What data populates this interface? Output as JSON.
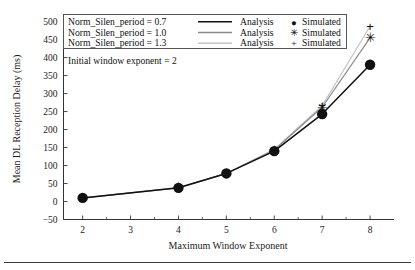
{
  "chart_data": {
    "type": "line",
    "title": "",
    "xlabel": "Maximum Window Exponent",
    "ylabel": "Mean DL Reception Delay (ms)",
    "xlim": [
      1.6,
      8.5
    ],
    "ylim": [
      -50,
      510
    ],
    "grid": false,
    "legend_position": "top-left-inside",
    "x": [
      2,
      4,
      5,
      6,
      7,
      8
    ],
    "xticks": [
      2,
      3,
      4,
      5,
      6,
      7,
      8
    ],
    "xtick_labels": [
      "2",
      "3",
      "4",
      "5",
      "6",
      "7",
      "8"
    ],
    "yticks": [
      -50,
      0,
      50,
      100,
      150,
      200,
      250,
      300,
      350,
      400,
      450,
      500
    ],
    "ytick_labels": [
      "−50",
      "0",
      "50",
      "100",
      "150",
      "200",
      "250",
      "300",
      "350",
      "400",
      "450",
      "500"
    ],
    "annotation": "Initial window exponent = 2",
    "series": [
      {
        "name": "Norm_Silen_period = 0.7",
        "analysis_label": "Analysis",
        "simulated_label": "Simulated",
        "marker": "circle",
        "color": "#111111",
        "line_width": 1.5,
        "values": [
          10,
          38,
          78,
          140,
          243,
          380
        ]
      },
      {
        "name": "Norm_Silen_period = 1.0",
        "analysis_label": "Analysis",
        "simulated_label": "Simulated",
        "marker": "asterisk",
        "color": "#8a8a8a",
        "line_width": 1.2,
        "values": [
          10,
          38,
          78,
          143,
          262,
          455
        ]
      },
      {
        "name": "Norm_Silen_period = 1.3",
        "analysis_label": "Analysis",
        "simulated_label": "Simulated",
        "marker": "plus",
        "color": "#c2c2c2",
        "line_width": 1.2,
        "values": [
          10,
          38,
          78,
          145,
          266,
          487
        ]
      }
    ]
  },
  "legend": {
    "rows": [
      {
        "name": "Norm_Silen_period = 0.7",
        "analysis": "Analysis",
        "simulated": "Simulated",
        "glyph": "●",
        "color": "#111111"
      },
      {
        "name": "Norm_Silen_period = 1.0",
        "analysis": "Analysis",
        "simulated": "Simulated",
        "glyph": "✳",
        "color": "#8a8a8a"
      },
      {
        "name": "Norm_Silen_period = 1.3",
        "analysis": "Analysis",
        "simulated": "Simulated",
        "glyph": "+",
        "color": "#c2c2c2"
      }
    ]
  },
  "annotation": {
    "text": "Initial window exponent = 2"
  },
  "axes": {
    "x_title": "Maximum Window Exponent",
    "y_title": "Mean DL Reception Delay (ms)"
  }
}
